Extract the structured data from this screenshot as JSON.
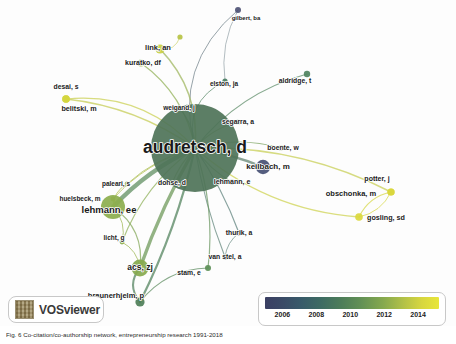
{
  "app": {
    "tool_name": "VOSviewer",
    "logo_icon": "vosviewer-logo-icon"
  },
  "legend": {
    "ticks": [
      "2006",
      "2008",
      "2010",
      "2012",
      "2014"
    ],
    "gradient_start_color": "#3b3f63",
    "gradient_mid_color": "#5f8d55",
    "gradient_end_color": "#e8e63a"
  },
  "caption": {
    "text": "Fig. 6  Co-citation/co-authorship network, entrepreneurship research 1991-2018"
  },
  "chart_data": {
    "type": "scatter",
    "title": "",
    "xlabel": "",
    "ylabel": "",
    "colorbar_label": "year",
    "colorbar_ticks": [
      2006,
      2008,
      2010,
      2012,
      2014
    ],
    "colorbar_range": [
      2005,
      2015
    ],
    "legend_position": "bottom-right",
    "grid": false,
    "nodes": [
      {
        "id": "audretsch_d",
        "label": "audretsch, d",
        "x": 195,
        "y": 148,
        "r": 44.0,
        "year": 2010,
        "color": "#4e7358",
        "font": 17.5,
        "lx": 195,
        "ly": 148
      },
      {
        "id": "gilbert_ba",
        "label": "gilbert, ba",
        "x": 238,
        "y": 10,
        "r": 3.0,
        "year": 2006,
        "color": "#4e5275",
        "font": 6.0,
        "lx": 246,
        "ly": 18
      },
      {
        "id": "link_an",
        "label": "link, an",
        "x": 160,
        "y": 49,
        "r": 4.6,
        "year": 2014,
        "color": "#c9cf42",
        "font": 7.5,
        "lx": 158,
        "ly": 48
      },
      {
        "id": "link_sat",
        "label": "",
        "x": 180,
        "y": 37,
        "r": 2.6,
        "year": 2014,
        "color": "#b7c345",
        "font": 0,
        "lx": 0,
        "ly": 0
      },
      {
        "id": "kuratko_df",
        "label": "kuratko, df",
        "x": 141,
        "y": 63,
        "r": 3.6,
        "year": 2013,
        "color": "#9cb64a",
        "font": 7.0,
        "lx": 143,
        "ly": 63
      },
      {
        "id": "elston_ja",
        "label": "elston, ja",
        "x": 225,
        "y": 81,
        "r": 2.6,
        "year": 2009,
        "color": "#4a7d63",
        "font": 6.5,
        "lx": 224,
        "ly": 84
      },
      {
        "id": "aldridge_t",
        "label": "aldridge, t",
        "x": 307,
        "y": 74,
        "r": 3.2,
        "year": 2010,
        "color": "#4f8360",
        "font": 6.8,
        "lx": 295,
        "ly": 81
      },
      {
        "id": "desai_s",
        "label": "desai, s",
        "x": 66,
        "y": 99,
        "r": 3.8,
        "year": 2015,
        "color": "#d4d63e",
        "font": 6.8,
        "lx": 66,
        "ly": 87
      },
      {
        "id": "belitski_m",
        "label": "belitski, m",
        "x": 66,
        "y": 99,
        "r": 3.8,
        "year": 2015,
        "color": "#d4d63e",
        "font": 7.2,
        "lx": 79,
        "ly": 109
      },
      {
        "id": "weigand_j",
        "label": "weigand, j",
        "x": 179,
        "y": 108,
        "r": 2.6,
        "year": 2009,
        "color": "#4b7a60",
        "font": 6.5,
        "lx": 179,
        "ly": 108
      },
      {
        "id": "segarra_a",
        "label": "segarra, a",
        "x": 238,
        "y": 122,
        "r": 2.6,
        "year": 2012,
        "color": "#7aa050",
        "font": 6.8,
        "lx": 238,
        "ly": 122
      },
      {
        "id": "boente_w",
        "label": "boente, w",
        "x": 281,
        "y": 148,
        "r": 2.8,
        "year": 2011,
        "color": "#6a9755",
        "font": 6.8,
        "lx": 283,
        "ly": 148
      },
      {
        "id": "keilbach_m",
        "label": "keilbach, m",
        "x": 263,
        "y": 167,
        "r": 7.2,
        "year": 2007,
        "color": "#465074",
        "font": 8.0,
        "lx": 268,
        "ly": 167
      },
      {
        "id": "lehmann_e",
        "label": "lehmann, e",
        "x": 232,
        "y": 182,
        "r": 2.6,
        "year": 2009,
        "color": "#4f7d5e",
        "font": 7.0,
        "lx": 232,
        "ly": 182
      },
      {
        "id": "potter_j",
        "label": "potter, j",
        "x": 391,
        "y": 192,
        "r": 3.6,
        "year": 2015,
        "color": "#d9d73d",
        "font": 7.0,
        "lx": 377,
        "ly": 179
      },
      {
        "id": "obschonka_m",
        "label": "obschonka, m",
        "x": 391,
        "y": 192,
        "r": 3.6,
        "year": 2015,
        "color": "#d9d73d",
        "font": 7.5,
        "lx": 351,
        "ly": 194
      },
      {
        "id": "gosling_sd",
        "label": "gosling, sd",
        "x": 359,
        "y": 217,
        "r": 3.8,
        "year": 2015,
        "color": "#dbd83d",
        "font": 7.2,
        "lx": 386,
        "ly": 218
      },
      {
        "id": "paleari_s",
        "label": "paleari, s",
        "x": 127,
        "y": 184,
        "r": 2.4,
        "year": 2013,
        "color": "#a8bb48",
        "font": 6.5,
        "lx": 116,
        "ly": 184
      },
      {
        "id": "dohse_d",
        "label": "dohse, d",
        "x": 172,
        "y": 183,
        "r": 2.6,
        "year": 2012,
        "color": "#81a44f",
        "font": 6.8,
        "lx": 172,
        "ly": 183
      },
      {
        "id": "huelsbeck_m",
        "label": "huelsbeck, m",
        "x": 113,
        "y": 199,
        "r": 2.4,
        "year": 2013,
        "color": "#b0bf47",
        "font": 6.5,
        "lx": 80,
        "ly": 199
      },
      {
        "id": "lehmann_ee",
        "label": "lehmann, ee",
        "x": 113,
        "y": 207,
        "r": 12.0,
        "year": 2012,
        "color": "#8cae4d",
        "font": 9.5,
        "lx": 109,
        "ly": 210
      },
      {
        "id": "licht_g",
        "label": "licht, g",
        "x": 122,
        "y": 242,
        "r": 2.4,
        "year": 2012,
        "color": "#8cae4d",
        "font": 6.5,
        "lx": 114,
        "ly": 238
      },
      {
        "id": "thurik_a",
        "label": "thurik, a",
        "x": 239,
        "y": 233,
        "r": 2.6,
        "year": 2008,
        "color": "#3f6a69",
        "font": 6.8,
        "lx": 239,
        "ly": 233
      },
      {
        "id": "van_stel_a",
        "label": "van stel, a",
        "x": 225,
        "y": 257,
        "r": 2.6,
        "year": 2008,
        "color": "#43706a",
        "font": 6.8,
        "lx": 225,
        "ly": 257
      },
      {
        "id": "stam_e",
        "label": "stam, e",
        "x": 208,
        "y": 268,
        "r": 3.0,
        "year": 2011,
        "color": "#5c8f57",
        "font": 6.8,
        "lx": 189,
        "ly": 273
      },
      {
        "id": "acs_zj",
        "label": "acs, zj",
        "x": 140,
        "y": 268,
        "r": 8.5,
        "year": 2012,
        "color": "#86a94e",
        "font": 8.5,
        "lx": 140,
        "ly": 268
      },
      {
        "id": "braunerhjelm_p",
        "label": "braunerhjelm, p",
        "x": 140,
        "y": 302,
        "r": 4.6,
        "year": 2011,
        "color": "#4e7f58",
        "font": 7.5,
        "lx": 116,
        "ly": 296
      }
    ],
    "edges": [
      {
        "source": "audretsch_d",
        "target": "gilbert_ba",
        "w": 1.0,
        "color": "#6f7f88",
        "curve": -46
      },
      {
        "source": "audretsch_d",
        "target": "link_an",
        "w": 1.6,
        "color": "#9cb45a",
        "curve": 24
      },
      {
        "source": "link_an",
        "target": "link_sat",
        "w": 0.8,
        "color": "#c2cb50",
        "curve": 10
      },
      {
        "source": "audretsch_d",
        "target": "kuratko_df",
        "w": 1.3,
        "color": "#8fae53",
        "curve": 20
      },
      {
        "source": "audretsch_d",
        "target": "elston_ja",
        "w": 1.0,
        "color": "#5a8a6a",
        "curve": -30
      },
      {
        "source": "gilbert_ba",
        "target": "elston_ja",
        "w": 0.8,
        "color": "#7b8b93",
        "curve": 12
      },
      {
        "source": "audretsch_d",
        "target": "aldridge_t",
        "w": 1.2,
        "color": "#5c8a66",
        "curve": -22
      },
      {
        "source": "audretsch_d",
        "target": "belitski_m",
        "w": 1.4,
        "color": "#c3cb51",
        "curve": 18
      },
      {
        "source": "audretsch_d",
        "target": "desai_s",
        "w": 1.2,
        "color": "#c9cf4d",
        "curve": 34
      },
      {
        "source": "audretsch_d",
        "target": "weigand_j",
        "w": 1.1,
        "color": "#6a9268",
        "curve": 8
      },
      {
        "source": "audretsch_d",
        "target": "segarra_a",
        "w": 1.1,
        "color": "#84a55a",
        "curve": -8
      },
      {
        "source": "audretsch_d",
        "target": "boente_w",
        "w": 1.2,
        "color": "#79a15c",
        "curve": -12
      },
      {
        "source": "audretsch_d",
        "target": "keilbach_m",
        "w": 2.4,
        "color": "#5e7f6c",
        "curve": -4
      },
      {
        "source": "audretsch_d",
        "target": "lehmann_e",
        "w": 1.1,
        "color": "#6f9a60",
        "curve": 6
      },
      {
        "source": "audretsch_d",
        "target": "obschonka_m",
        "w": 1.5,
        "color": "#c6cd50",
        "curve": -26
      },
      {
        "source": "audretsch_d",
        "target": "gosling_sd",
        "w": 1.3,
        "color": "#cdd14c",
        "curve": 30
      },
      {
        "source": "obschonka_m",
        "target": "gosling_sd",
        "w": 1.2,
        "color": "#d6d743",
        "curve": 10
      },
      {
        "source": "obschonka_m",
        "target": "potter_j",
        "w": 1.0,
        "color": "#d6d743",
        "curve": 8
      },
      {
        "source": "potter_j",
        "target": "gosling_sd",
        "w": 1.0,
        "color": "#d6d743",
        "curve": -10
      },
      {
        "source": "audretsch_d",
        "target": "paleari_s",
        "w": 1.0,
        "color": "#a8bb52",
        "curve": 10
      },
      {
        "source": "audretsch_d",
        "target": "dohse_d",
        "w": 1.1,
        "color": "#86a65a",
        "curve": 4
      },
      {
        "source": "audretsch_d",
        "target": "huelsbeck_m",
        "w": 1.0,
        "color": "#b2c04e",
        "curve": 14
      },
      {
        "source": "audretsch_d",
        "target": "lehmann_ee",
        "w": 4.2,
        "color": "#5a8a5c",
        "curve": 10
      },
      {
        "source": "lehmann_ee",
        "target": "paleari_s",
        "w": 1.0,
        "color": "#b0bf4c",
        "curve": -8
      },
      {
        "source": "lehmann_ee",
        "target": "huelsbeck_m",
        "w": 1.0,
        "color": "#b6c34b",
        "curve": 4
      },
      {
        "source": "lehmann_ee",
        "target": "licht_g",
        "w": 1.0,
        "color": "#9cb650",
        "curve": -10
      },
      {
        "source": "audretsch_d",
        "target": "licht_g",
        "w": 1.1,
        "color": "#8cae56",
        "curve": 18
      },
      {
        "source": "audretsch_d",
        "target": "thurik_a",
        "w": 1.2,
        "color": "#5c7f7a",
        "curve": -6
      },
      {
        "source": "audretsch_d",
        "target": "van_stel_a",
        "w": 1.1,
        "color": "#5f8479",
        "curve": 6
      },
      {
        "source": "thurik_a",
        "target": "van_stel_a",
        "w": 0.9,
        "color": "#5d8279",
        "curve": 6
      },
      {
        "source": "audretsch_d",
        "target": "stam_e",
        "w": 1.2,
        "color": "#6a9560",
        "curve": -14
      },
      {
        "source": "audretsch_d",
        "target": "acs_zj",
        "w": 3.4,
        "color": "#6a9555",
        "curve": 6
      },
      {
        "source": "acs_zj",
        "target": "braunerhjelm_p",
        "w": 2.0,
        "color": "#4f7f5c",
        "curve": 14
      },
      {
        "source": "acs_zj",
        "target": "licht_g",
        "w": 1.0,
        "color": "#9ab44f",
        "curve": 8
      },
      {
        "source": "audretsch_d",
        "target": "braunerhjelm_p",
        "w": 2.2,
        "color": "#4e8059",
        "curve": -10
      },
      {
        "source": "braunerhjelm_p",
        "target": "stam_e",
        "w": 1.2,
        "color": "#5b8a5e",
        "curve": -18
      },
      {
        "source": "lehmann_ee",
        "target": "acs_zj",
        "w": 1.2,
        "color": "#7fa553",
        "curve": -20
      }
    ]
  }
}
